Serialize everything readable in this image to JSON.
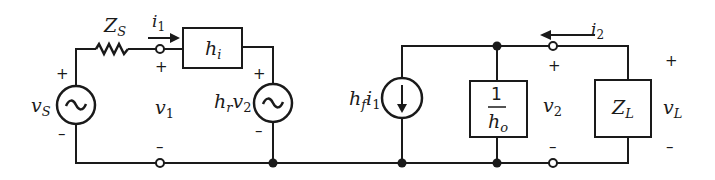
{
  "diagram": {
    "type": "circuit",
    "colors": {
      "line": "#1a1a1a",
      "background": "#ffffff"
    },
    "labels": {
      "source_impedance": "Z",
      "source_impedance_sub": "S",
      "source_voltage": "v",
      "source_voltage_sub": "S",
      "input_current": "i",
      "input_current_sub": "1",
      "input_impedance": "h",
      "input_impedance_sub": "i",
      "input_voltage": "v",
      "input_voltage_sub": "1",
      "reverse_source": "h",
      "reverse_source_sub": "r",
      "reverse_source_var": "v",
      "reverse_source_var_sub": "2",
      "forward_source": "h",
      "forward_source_sub": "f",
      "forward_source_var": "i",
      "forward_source_var_sub": "1",
      "output_admittance_num": "1",
      "output_admittance_den": "h",
      "output_admittance_den_sub": "o",
      "output_voltage": "v",
      "output_voltage_sub": "2",
      "output_current": "i",
      "output_current_sub": "2",
      "load_impedance": "Z",
      "load_impedance_sub": "L",
      "load_voltage": "v",
      "load_voltage_sub": "L",
      "plus": "+",
      "minus": "–"
    }
  }
}
